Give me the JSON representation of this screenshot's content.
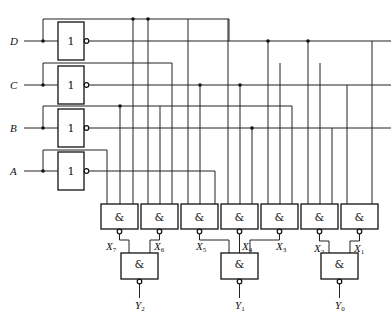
{
  "diagram": {
    "type": "logic-circuit",
    "top_caption_cut_off": "",
    "inputs": [
      {
        "id": "D",
        "label": "D"
      },
      {
        "id": "C",
        "label": "C"
      },
      {
        "id": "B",
        "label": "B"
      },
      {
        "id": "A",
        "label": "A"
      }
    ],
    "inverter_symbol": "1",
    "nand_symbol": "&",
    "first_level_gates": [
      {
        "output": "X7",
        "label": "X",
        "sub": "7"
      },
      {
        "output": "X6",
        "label": "X",
        "sub": "6"
      },
      {
        "output": "X5",
        "label": "X",
        "sub": "5"
      },
      {
        "output": "X4",
        "label": "X",
        "sub": "4"
      },
      {
        "output": "X3",
        "label": "X",
        "sub": "3"
      },
      {
        "output": "X2",
        "label": "X",
        "sub": "2"
      },
      {
        "output": "X1",
        "label": "X",
        "sub": "1"
      }
    ],
    "second_level_gates": [
      {
        "inputs": [
          "X7",
          "X6"
        ],
        "output": "Y2",
        "label": "Y",
        "sub": "2"
      },
      {
        "inputs": [
          "X5",
          "X4",
          "X3"
        ],
        "output": "Y1",
        "label": "Y",
        "sub": "1"
      },
      {
        "inputs": [
          "X2",
          "X1"
        ],
        "output": "Y0",
        "label": "Y",
        "sub": "0"
      }
    ],
    "colors": {
      "line": "#222222",
      "background": "#ffffff"
    }
  }
}
